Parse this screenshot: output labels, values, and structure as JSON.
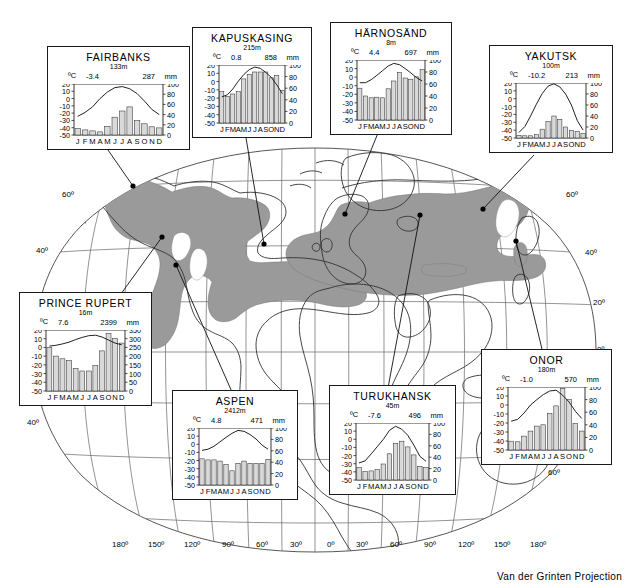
{
  "figure": {
    "projection_note": "Van der Grinten Projection",
    "shaded_region_name": "taiga-boreal-forest",
    "shade_color": "#9a9a9a",
    "ocean_color": "#ffffff",
    "land_outline_color": "#333333",
    "graticule_color": "#555555"
  },
  "graticule": {
    "longitude_labels": [
      "180º",
      "150º",
      "120º",
      "90º",
      "60º",
      "30º",
      "0º",
      "30º",
      "60º",
      "90º",
      "120º",
      "150º",
      "180º"
    ],
    "latitude_labels_left": [
      "60º",
      "40º",
      "40º"
    ],
    "latitude_labels_right": [
      "60º",
      "40º",
      "20º",
      "0º",
      "60º"
    ]
  },
  "chart_data": [
    {
      "type": "bar",
      "id": "fairbanks",
      "title": "FAIRBANKS",
      "elevation": "133m",
      "temp_mean": "-3.4",
      "precip_total": "287",
      "unit_left": "ºC",
      "unit_right": "mm",
      "categories": [
        "J",
        "F",
        "M",
        "A",
        "M",
        "J",
        "J",
        "A",
        "S",
        "O",
        "N",
        "D"
      ],
      "ylabel": "",
      "xlabel": "",
      "ylim": [
        -50,
        20
      ],
      "y_ticks": [
        "20",
        "10",
        "0",
        "-10",
        "-20",
        "-30",
        "-40",
        "-50"
      ],
      "ylim_right": [
        0,
        100
      ],
      "y_ticks_right": [
        "100",
        "80",
        "60",
        "40",
        "20",
        "0"
      ],
      "series": [
        {
          "name": "precipitation",
          "type": "bar",
          "values": [
            13,
            10,
            8,
            6,
            17,
            35,
            47,
            55,
            28,
            22,
            16,
            14
          ]
        },
        {
          "name": "temperature",
          "type": "line",
          "values": [
            -24.5,
            -19,
            -11.5,
            0,
            9,
            15,
            16.5,
            13.5,
            7,
            -3.5,
            -15,
            -22
          ]
        }
      ]
    },
    {
      "type": "bar",
      "id": "kapuskasing",
      "title": "KAPUSKASING",
      "elevation": "215m",
      "temp_mean": "0.8",
      "precip_total": "858",
      "unit_left": "ºC",
      "unit_right": "mm",
      "categories": [
        "J",
        "F",
        "M",
        "A",
        "M",
        "J",
        "J",
        "A",
        "S",
        "O",
        "N",
        "D"
      ],
      "ylabel": "",
      "xlabel": "",
      "ylim": [
        -50,
        20
      ],
      "y_ticks": [
        "20",
        "10",
        "0",
        "-10",
        "-20",
        "-30",
        "-40",
        "-50"
      ],
      "ylim_right": [
        0,
        100
      ],
      "y_ticks_right": [
        "100",
        "80",
        "60",
        "40",
        "20",
        "0"
      ],
      "series": [
        {
          "name": "precipitation",
          "type": "bar",
          "values": [
            54,
            46,
            50,
            54,
            76,
            84,
            88,
            88,
            88,
            78,
            82,
            56
          ]
        },
        {
          "name": "temperature",
          "type": "line",
          "values": [
            -18.5,
            -16,
            -9,
            0.5,
            8.5,
            14.5,
            17.5,
            16,
            11,
            5,
            -4,
            -14.5
          ]
        }
      ]
    },
    {
      "type": "bar",
      "id": "harnosand",
      "title": "HÄRNOSÄND",
      "elevation": "8m",
      "temp_mean": "4.4",
      "precip_total": "697",
      "unit_left": "ºC",
      "unit_right": "mm",
      "categories": [
        "J",
        "F",
        "M",
        "A",
        "M",
        "J",
        "J",
        "A",
        "S",
        "O",
        "N",
        "D"
      ],
      "ylabel": "",
      "xlabel": "",
      "ylim": [
        -50,
        20
      ],
      "y_ticks": [
        "20",
        "10",
        "0",
        "-10",
        "-20",
        "-30",
        "-40",
        "-50"
      ],
      "ylim_right": [
        0,
        100
      ],
      "y_ticks_right": [
        "100",
        "80",
        "60",
        "40",
        "20",
        "0"
      ],
      "series": [
        {
          "name": "precipitation",
          "type": "bar",
          "values": [
            53,
            40,
            37,
            38,
            37,
            52,
            65,
            79,
            70,
            68,
            72,
            84
          ]
        },
        {
          "name": "temperature",
          "type": "line",
          "values": [
            -6.5,
            -6.5,
            -3,
            2,
            7.5,
            13,
            16,
            14.5,
            10,
            5,
            -0.5,
            -4.5
          ]
        }
      ]
    },
    {
      "type": "bar",
      "id": "yakutsk",
      "title": "YAKUTSK",
      "elevation": "100m",
      "temp_mean": "-10.2",
      "precip_total": "213",
      "unit_left": "ºC",
      "unit_right": "mm",
      "categories": [
        "J",
        "F",
        "M",
        "A",
        "M",
        "J",
        "J",
        "A",
        "S",
        "O",
        "N",
        "D"
      ],
      "ylabel": "",
      "xlabel": "",
      "ylim": [
        -50,
        20
      ],
      "y_ticks": [
        "20",
        "10",
        "0",
        "-10",
        "-20",
        "-30",
        "-40",
        "-50"
      ],
      "ylim_right": [
        0,
        100
      ],
      "y_ticks_right": [
        "100",
        "80",
        "60",
        "40",
        "20",
        "0"
      ],
      "series": [
        {
          "name": "precipitation",
          "type": "bar",
          "values": [
            5,
            4,
            4,
            6,
            16,
            30,
            40,
            34,
            20,
            14,
            12,
            8
          ]
        },
        {
          "name": "temperature",
          "type": "line",
          "values": [
            -43,
            -35.5,
            -22,
            -7,
            6.5,
            16,
            19,
            15,
            6,
            -8,
            -28,
            -40
          ]
        }
      ]
    },
    {
      "type": "bar",
      "id": "prince-rupert",
      "title": "PRINCE RUPERT",
      "elevation": "16m",
      "temp_mean": "7.6",
      "precip_total": "2399",
      "unit_left": "ºC",
      "unit_right": "mm",
      "categories": [
        "J",
        "F",
        "M",
        "A",
        "M",
        "J",
        "J",
        "A",
        "S",
        "O",
        "N",
        "D"
      ],
      "ylabel": "",
      "xlabel": "",
      "ylim": [
        -50,
        20
      ],
      "y_ticks": [
        "20",
        "10",
        "0",
        "-10",
        "-20",
        "-30",
        "-40",
        "-50"
      ],
      "ylim_right": [
        0,
        350
      ],
      "y_ticks_right": [
        "350",
        "300",
        "250",
        "200",
        "150",
        "100",
        "50",
        "0"
      ],
      "series": [
        {
          "name": "precipitation",
          "type": "bar",
          "values": [
            250,
            200,
            185,
            175,
            130,
            115,
            115,
            145,
            230,
            330,
            300,
            275
          ]
        },
        {
          "name": "temperature",
          "type": "line",
          "values": [
            1.5,
            2.5,
            4,
            6,
            9,
            11.5,
            13.5,
            14,
            12,
            8.5,
            5,
            3
          ]
        }
      ]
    },
    {
      "type": "bar",
      "id": "aspen",
      "title": "ASPEN",
      "elevation": "2412m",
      "temp_mean": "4.8",
      "precip_total": "471",
      "unit_left": "ºC",
      "unit_right": "mm",
      "categories": [
        "J",
        "F",
        "M",
        "A",
        "M",
        "J",
        "J",
        "A",
        "S",
        "O",
        "N",
        "D"
      ],
      "ylabel": "",
      "xlabel": "",
      "ylim": [
        -50,
        20
      ],
      "y_ticks": [
        "20",
        "10",
        "0",
        "-10",
        "-20",
        "-30",
        "-40",
        "-50"
      ],
      "ylim_right": [
        0,
        100
      ],
      "y_ticks_right": [
        "100",
        "80",
        "60",
        "40",
        "20",
        "0"
      ],
      "series": [
        {
          "name": "precipitation",
          "type": "bar",
          "values": [
            46,
            44,
            44,
            42,
            36,
            25,
            38,
            42,
            38,
            38,
            38,
            45
          ]
        },
        {
          "name": "temperature",
          "type": "line",
          "values": [
            -7.5,
            -6,
            -2.5,
            3,
            8.5,
            13.5,
            17,
            16,
            12,
            6.5,
            -1,
            -6
          ]
        }
      ]
    },
    {
      "type": "bar",
      "id": "turukhansk",
      "title": "TURUKHANSK",
      "elevation": "45m",
      "temp_mean": "-7.6",
      "precip_total": "496",
      "unit_left": "ºC",
      "unit_right": "mm",
      "categories": [
        "J",
        "F",
        "M",
        "A",
        "M",
        "J",
        "J",
        "A",
        "S",
        "O",
        "N",
        "D"
      ],
      "ylabel": "",
      "xlabel": "",
      "ylim": [
        -50,
        20
      ],
      "y_ticks": [
        "20",
        "10",
        "0",
        "-10",
        "-20",
        "-30",
        "-40",
        "-50"
      ],
      "ylim_right": [
        0,
        100
      ],
      "y_ticks_right": [
        "100",
        "80",
        "60",
        "40",
        "20",
        "0"
      ],
      "series": [
        {
          "name": "precipitation",
          "type": "bar",
          "values": [
            22,
            15,
            16,
            18,
            28,
            46,
            64,
            68,
            58,
            44,
            24,
            22
          ]
        },
        {
          "name": "temperature",
          "type": "line",
          "values": [
            -29,
            -26.5,
            -18,
            -9,
            0,
            11,
            16,
            12.5,
            5,
            -7,
            -21,
            -27
          ]
        }
      ]
    },
    {
      "type": "bar",
      "id": "onor",
      "title": "ONOR",
      "elevation": "180m",
      "temp_mean": "-1.0",
      "precip_total": "570",
      "unit_left": "ºC",
      "unit_right": "mm",
      "categories": [
        "J",
        "F",
        "M",
        "A",
        "M",
        "J",
        "J",
        "A",
        "S",
        "O",
        "N",
        "D"
      ],
      "ylabel": "",
      "xlabel": "",
      "ylim": [
        -50,
        20
      ],
      "y_ticks": [
        "20",
        "10",
        "0",
        "-10",
        "-20",
        "-30",
        "-40",
        "-50"
      ],
      "ylim_right": [
        0,
        100
      ],
      "y_ticks_right": [
        "100",
        "80",
        "60",
        "40",
        "20",
        "0"
      ],
      "series": [
        {
          "name": "precipitation",
          "type": "bar",
          "values": [
            14,
            13,
            22,
            30,
            38,
            40,
            58,
            70,
            98,
            80,
            42,
            30
          ]
        },
        {
          "name": "temperature",
          "type": "line",
          "values": [
            -18,
            -16,
            -9,
            0,
            6,
            11.5,
            15.5,
            16.5,
            11,
            3.5,
            -7,
            -15
          ]
        }
      ]
    }
  ],
  "station_markers": [
    {
      "id": "fairbanks",
      "x": 133,
      "y": 186
    },
    {
      "id": "prince-rupert",
      "x": 162,
      "y": 237
    },
    {
      "id": "aspen",
      "x": 176,
      "y": 265
    },
    {
      "id": "kapuskasing",
      "x": 264,
      "y": 244
    },
    {
      "id": "harnosand",
      "x": 345,
      "y": 214
    },
    {
      "id": "turukhansk",
      "x": 420,
      "y": 215
    },
    {
      "id": "yakutsk",
      "x": 483,
      "y": 209
    },
    {
      "id": "onor",
      "x": 516,
      "y": 241
    }
  ]
}
